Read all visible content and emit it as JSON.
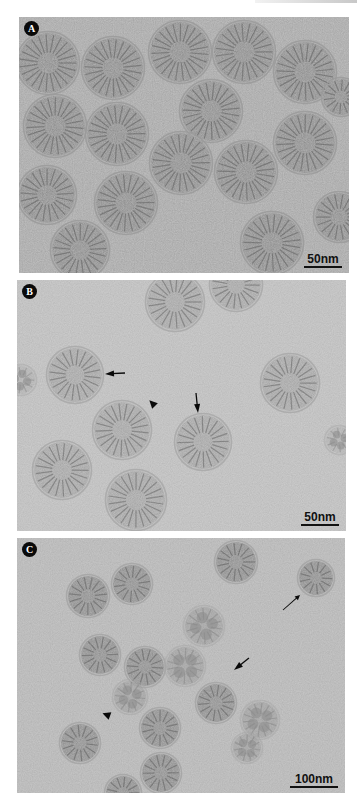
{
  "figure": {
    "panels": [
      {
        "label": "A",
        "scale_bar": "50nm",
        "annotations": []
      },
      {
        "label": "B",
        "scale_bar": "50nm",
        "annotations": [
          {
            "type": "arrow",
            "direction": "left"
          },
          {
            "type": "arrowhead",
            "direction": "down-left"
          },
          {
            "type": "arrow",
            "direction": "down"
          }
        ]
      },
      {
        "label": "C",
        "scale_bar": "100nm",
        "annotations": [
          {
            "type": "thin-arrow",
            "direction": "up-right"
          },
          {
            "type": "arrow",
            "direction": "down-left"
          },
          {
            "type": "arrowhead",
            "direction": "right"
          }
        ]
      }
    ],
    "colors": {
      "panel_a_background": "#6f6f6f",
      "panel_b_background": "#8b8b8b",
      "panel_c_background": "#7f7f7f",
      "label_badge": "#0a0a0a",
      "label_text": "#ffffff",
      "scale_bar": "#111111"
    }
  }
}
